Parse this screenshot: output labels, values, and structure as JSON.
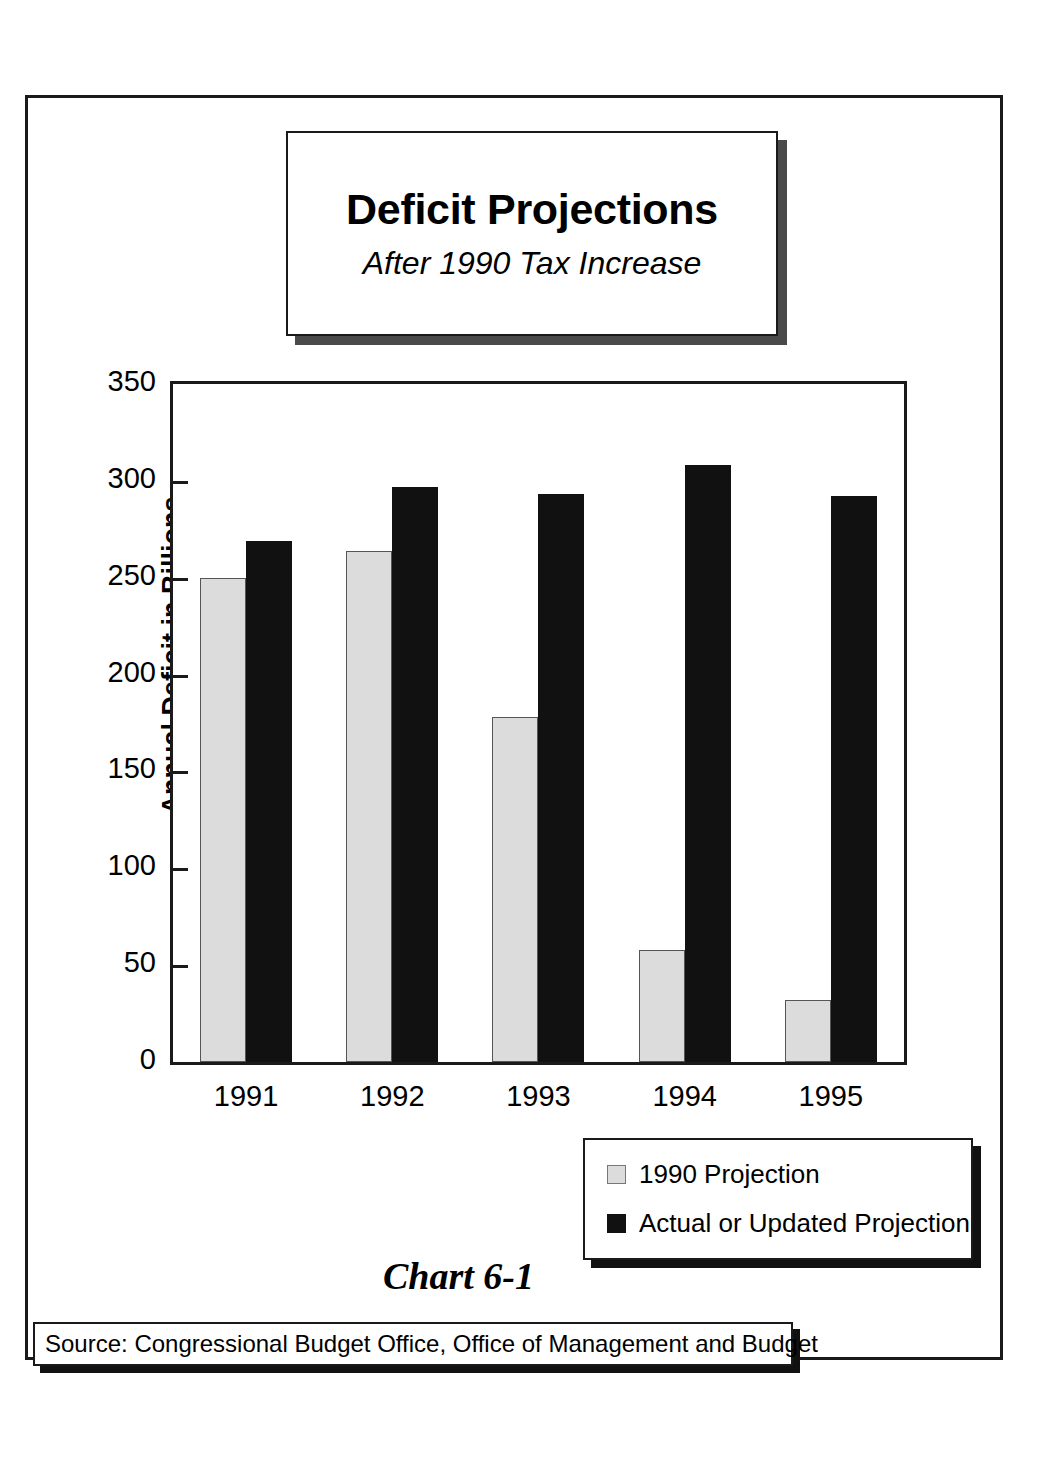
{
  "chart_data": {
    "type": "bar",
    "title": "Deficit Projections",
    "subtitle": "After 1990 Tax Increase",
    "xlabel": "",
    "ylabel": "Annual Deficit in Billions",
    "ylim": [
      0,
      350
    ],
    "yticks": [
      0,
      50,
      100,
      150,
      200,
      250,
      300,
      350
    ],
    "grid": false,
    "legend_position": "bottom-right",
    "categories": [
      "1991",
      "1992",
      "1993",
      "1994",
      "1995"
    ],
    "series": [
      {
        "name": "1990 Projection",
        "color": "#dcdcdc",
        "values": [
          250,
          264,
          178,
          58,
          32
        ]
      },
      {
        "name": "Actual or Updated Projection",
        "color": "#111111",
        "values": [
          269,
          297,
          293,
          308,
          292
        ]
      }
    ],
    "chart_number": "Chart 6-1",
    "source": "Source:  Congressional Budget Office, Office of Management and Budget"
  }
}
